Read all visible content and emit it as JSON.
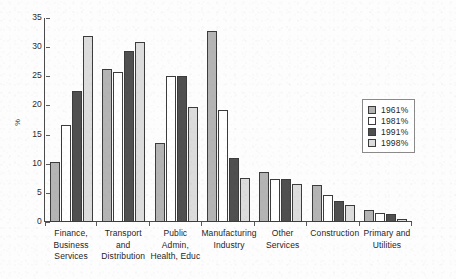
{
  "chart_data": {
    "type": "bar",
    "title": "",
    "subtitle": "",
    "xlabel": "",
    "ylabel": "%",
    "ylim": [
      0,
      35
    ],
    "yticks": [
      0,
      5,
      10,
      15,
      20,
      25,
      30,
      35
    ],
    "grid": false,
    "legend_position": "right",
    "orientation": "vertical",
    "grouping": "grouped",
    "categories": [
      "Finance, Business Services",
      "Transport and Distribution",
      "Public Admin, Health, Educ",
      "Manufacturing Industry",
      "Other Services",
      "Construction",
      "Primary and Utilities"
    ],
    "category_lines": [
      [
        "Finance, Business",
        "Services"
      ],
      [
        "Transport and",
        "Distribution"
      ],
      [
        "Public Admin,",
        "Health, Educ"
      ],
      [
        "Manufacturing",
        "Industry"
      ],
      [
        "Other",
        "Services"
      ],
      [
        "Construction",
        ""
      ],
      [
        "Primary and",
        "Utilities"
      ]
    ],
    "series": [
      {
        "name": "1961%",
        "color": "#b4b4b4",
        "values": [
          10.3,
          26.3,
          13.5,
          32.7,
          8.6,
          6.3,
          2.1
        ]
      },
      {
        "name": "1981%",
        "color": "#ffffff",
        "values": [
          16.6,
          25.7,
          25.0,
          19.2,
          7.4,
          4.6,
          1.6
        ]
      },
      {
        "name": "1991%",
        "color": "#505050",
        "values": [
          22.5,
          29.3,
          25.0,
          11.0,
          7.3,
          3.6,
          1.4
        ]
      },
      {
        "name": "1998%",
        "color": "#dcdcdc",
        "values": [
          32.0,
          30.9,
          19.8,
          7.5,
          6.6,
          2.9,
          0.5
        ]
      }
    ]
  }
}
